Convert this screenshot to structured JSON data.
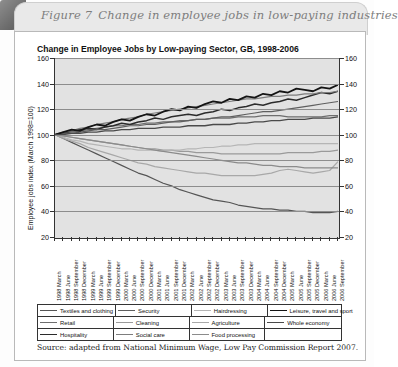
{
  "figure": {
    "number_label": "Figure 7",
    "caption": "Change in employee jobs in low-paying industries"
  },
  "source_note": "Source: adapted from National Minimum Wage, Low Pay Commission Report 2007.",
  "chart_data": {
    "type": "line",
    "title": "Change in Employee Jobs by Low-paying Sector, GB, 1998-2006",
    "xlabel": "",
    "ylabel": "Employee jobs index (March 1998=100)",
    "ylim": [
      20,
      160
    ],
    "ytick_values": [
      20,
      40,
      60,
      80,
      100,
      120,
      140,
      160
    ],
    "ytick_labels": [
      "20",
      "40",
      "60",
      "80",
      "100",
      "120",
      "140",
      "160"
    ],
    "grid": true,
    "grid_axis": "y",
    "dual_y_axis": true,
    "legend_position": "below",
    "plot_background": "#e2e2e2",
    "categories": [
      "1998 March",
      "1998 June",
      "1998 September",
      "1998 December",
      "1999 March",
      "1999 June",
      "1999 September",
      "1999 December",
      "2000 March",
      "2000 June",
      "2000 September",
      "2000 December",
      "2001 March",
      "2001 June",
      "2001 September",
      "2001 December",
      "2002 March",
      "2002 June",
      "2002 September",
      "2002 December",
      "2003 March",
      "2003 June",
      "2003 September",
      "2003 December",
      "2004 March",
      "2004 June",
      "2004 September",
      "2004 December",
      "2005 March",
      "2005 June",
      "2005 September",
      "2005 December",
      "2006 March",
      "2006 June",
      "2006 September"
    ],
    "series": [
      {
        "name": "Textiles and clothing",
        "color": "#555555",
        "width": 1.2,
        "values": [
          100,
          97,
          94,
          91,
          88,
          85,
          82,
          79,
          76,
          73,
          70,
          68,
          65,
          62,
          60,
          57,
          55,
          53,
          51,
          49,
          48,
          47,
          45,
          44,
          43,
          42,
          42,
          41,
          41,
          40,
          40,
          39,
          39,
          39,
          40
        ]
      },
      {
        "name": "Retail",
        "color": "#6e6e6e",
        "width": 1.2,
        "values": [
          100,
          101,
          102,
          103,
          104,
          105,
          106,
          107,
          107,
          108,
          108,
          109,
          109,
          110,
          110,
          111,
          111,
          112,
          112,
          113,
          113,
          113,
          114,
          114,
          114,
          115,
          115,
          115,
          114,
          114,
          114,
          114,
          114,
          115,
          115
        ]
      },
      {
        "name": "Hospitality",
        "color": "#2b2b2b",
        "width": 1.5,
        "values": [
          100,
          101,
          103,
          104,
          105,
          104,
          106,
          107,
          109,
          108,
          110,
          111,
          113,
          112,
          114,
          115,
          116,
          115,
          117,
          118,
          120,
          119,
          121,
          122,
          124,
          123,
          125,
          126,
          128,
          127,
          129,
          131,
          133,
          132,
          134
        ]
      },
      {
        "name": "Security",
        "color": "#5f5f5f",
        "width": 1.2,
        "values": [
          100,
          101,
          101,
          102,
          103,
          104,
          104,
          105,
          106,
          107,
          107,
          108,
          108,
          109,
          110,
          110,
          111,
          112,
          112,
          113,
          114,
          114,
          115,
          116,
          117,
          118,
          118,
          119,
          120,
          121,
          122,
          123,
          124,
          125,
          126
        ]
      },
      {
        "name": "Cleaning",
        "color": "#9a9a9a",
        "width": 1.2,
        "values": [
          100,
          99,
          98,
          97,
          96,
          95,
          94,
          93,
          92,
          91,
          90,
          89,
          89,
          88,
          88,
          87,
          87,
          86,
          86,
          86,
          85,
          85,
          85,
          85,
          85,
          85,
          85,
          85,
          86,
          86,
          86,
          86,
          87,
          87,
          88
        ]
      },
      {
        "name": "Social care",
        "color": "#7d7d7d",
        "width": 1.2,
        "values": [
          100,
          102,
          103,
          105,
          106,
          108,
          109,
          110,
          112,
          113,
          114,
          116,
          117,
          118,
          119,
          120,
          121,
          122,
          123,
          124,
          125,
          126,
          127,
          128,
          128,
          129,
          130,
          130,
          131,
          131,
          132,
          132,
          133,
          133,
          134
        ]
      },
      {
        "name": "Hairdressing",
        "color": "#b5b5b5",
        "width": 1.2,
        "values": [
          100,
          98,
          96,
          95,
          93,
          92,
          91,
          90,
          89,
          89,
          88,
          88,
          88,
          87,
          88,
          88,
          89,
          89,
          90,
          90,
          91,
          91,
          92,
          92,
          93,
          93,
          93,
          93,
          93,
          93,
          93,
          93,
          93,
          93,
          93
        ]
      },
      {
        "name": "Agriculture",
        "color": "#a8a8a8",
        "width": 1.2,
        "values": [
          100,
          97,
          95,
          93,
          90,
          88,
          86,
          84,
          82,
          80,
          78,
          77,
          75,
          74,
          73,
          72,
          71,
          70,
          70,
          69,
          68,
          68,
          68,
          68,
          68,
          69,
          70,
          72,
          73,
          72,
          71,
          70,
          71,
          72,
          79
        ]
      },
      {
        "name": "Food processing",
        "color": "#8b8b8b",
        "width": 1.2,
        "values": [
          100,
          99,
          98,
          97,
          96,
          95,
          94,
          93,
          92,
          91,
          90,
          89,
          88,
          87,
          86,
          85,
          84,
          83,
          82,
          81,
          80,
          79,
          78,
          78,
          77,
          76,
          76,
          75,
          75,
          75,
          74,
          74,
          74,
          74,
          74
        ]
      },
      {
        "name": "Leisure, travel and sport",
        "color": "#141414",
        "width": 1.8,
        "values": [
          100,
          102,
          104,
          103,
          106,
          108,
          107,
          110,
          112,
          111,
          114,
          116,
          115,
          118,
          120,
          119,
          122,
          121,
          124,
          126,
          125,
          128,
          127,
          130,
          129,
          132,
          131,
          134,
          133,
          136,
          135,
          134,
          137,
          136,
          139
        ]
      },
      {
        "name": "Whole economy",
        "color": "#4a4a4a",
        "width": 1.3,
        "values": [
          100,
          100,
          101,
          101,
          102,
          102,
          103,
          103,
          104,
          104,
          105,
          105,
          105,
          106,
          106,
          106,
          107,
          107,
          107,
          108,
          108,
          108,
          109,
          109,
          110,
          110,
          111,
          111,
          112,
          112,
          112,
          113,
          113,
          113,
          114
        ]
      }
    ],
    "legend_rows": [
      [
        {
          "label": "Textiles and clothing",
          "color": "#555555",
          "width": 1.2
        },
        {
          "label": "Security",
          "color": "#5f5f5f",
          "width": 1.2
        },
        {
          "label": "Hairdressing",
          "color": "#b5b5b5",
          "width": 1.2
        },
        {
          "label": "Leisure, travel and sport",
          "color": "#141414",
          "width": 1.8
        }
      ],
      [
        {
          "label": "Retail",
          "color": "#6e6e6e",
          "width": 1.2
        },
        {
          "label": "Cleaning",
          "color": "#9a9a9a",
          "width": 1.2
        },
        {
          "label": "Agriculture",
          "color": "#a8a8a8",
          "width": 1.2
        },
        {
          "label": "Whole economy",
          "color": "#4a4a4a",
          "width": 1.3
        }
      ],
      [
        {
          "label": "Hospitality",
          "color": "#2b2b2b",
          "width": 1.5
        },
        {
          "label": "Social care",
          "color": "#7d7d7d",
          "width": 1.2
        },
        {
          "label": "Food processing",
          "color": "#8b8b8b",
          "width": 1.2
        },
        {
          "label": "",
          "color": "",
          "width": 0
        }
      ]
    ]
  }
}
